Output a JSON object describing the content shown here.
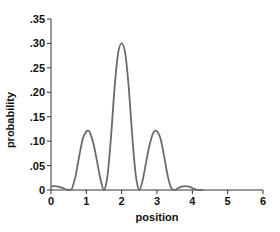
{
  "chart_data": {
    "type": "line",
    "title": "",
    "xlabel": "position",
    "ylabel": "probability",
    "xlim": [
      0,
      6
    ],
    "ylim": [
      0,
      0.35
    ],
    "grid": false,
    "legend": null,
    "x_ticks": [
      0,
      1,
      2,
      3,
      4,
      5,
      6
    ],
    "x_tick_labels": [
      "0",
      "1",
      "2",
      "3",
      "4",
      "5",
      "6"
    ],
    "y_ticks": [
      0,
      0.05,
      0.1,
      0.15,
      0.2,
      0.25,
      0.3,
      0.35
    ],
    "y_tick_labels": [
      "0",
      ".05",
      ".10",
      ".15",
      ".20",
      ".25",
      ".30",
      ".35"
    ],
    "series": [
      {
        "name": "probability",
        "color": "#6b6b6b",
        "x": [
          0.0,
          0.1,
          0.2,
          0.3,
          0.4,
          0.5,
          0.55,
          0.6,
          0.7,
          0.8,
          0.9,
          1.0,
          1.05,
          1.1,
          1.2,
          1.3,
          1.4,
          1.5,
          1.6,
          1.7,
          1.8,
          1.9,
          2.0,
          2.1,
          2.2,
          2.3,
          2.4,
          2.5,
          2.6,
          2.7,
          2.8,
          2.9,
          3.0,
          3.1,
          3.2,
          3.3,
          3.4,
          3.5,
          3.6,
          3.7,
          3.8,
          3.9,
          4.0,
          4.1,
          4.2,
          4.3
        ],
        "values": [
          0.007,
          0.008,
          0.007,
          0.005,
          0.002,
          0.0,
          0.0,
          0.004,
          0.03,
          0.07,
          0.105,
          0.12,
          0.121,
          0.118,
          0.095,
          0.06,
          0.022,
          0.0,
          0.03,
          0.11,
          0.21,
          0.28,
          0.3,
          0.28,
          0.21,
          0.11,
          0.03,
          0.0,
          0.022,
          0.06,
          0.095,
          0.118,
          0.12,
          0.105,
          0.07,
          0.03,
          0.004,
          0.0,
          0.004,
          0.007,
          0.008,
          0.007,
          0.004,
          0.001,
          0.0,
          0.0
        ]
      }
    ]
  }
}
